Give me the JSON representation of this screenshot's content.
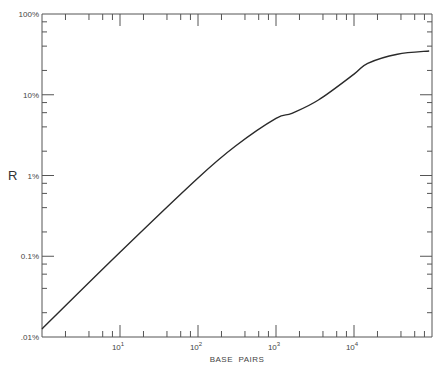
{
  "chart_data": {
    "type": "line",
    "title": "",
    "xlabel": "BASE  PAIRS",
    "ylabel": "R",
    "xscale": "log",
    "yscale": "log",
    "xlim": [
      1,
      100000
    ],
    "ylim": [
      0.01,
      100
    ],
    "grid": false,
    "legend": "none",
    "x_ticks": [
      {
        "value": 10,
        "base": "10",
        "exp": "1"
      },
      {
        "value": 100,
        "base": "10",
        "exp": "2"
      },
      {
        "value": 1000,
        "base": "10",
        "exp": "3"
      },
      {
        "value": 10000,
        "base": "10",
        "exp": "4"
      }
    ],
    "y_ticks": [
      {
        "value": 100,
        "label": "100%"
      },
      {
        "value": 10,
        "label": "10%"
      },
      {
        "value": 1,
        "label": "1%"
      },
      {
        "value": 0.1,
        "label": "0.1%"
      },
      {
        "value": 0.01,
        "label": ".01%"
      }
    ],
    "series": [
      {
        "name": "R",
        "x": [
          1,
          10,
          100,
          300,
          1000,
          1600,
          3500,
          10000,
          15000,
          36000,
          92000
        ],
        "y": [
          0.0126,
          0.112,
          0.93,
          2.3,
          5.1,
          5.9,
          8.6,
          18,
          24.5,
          31.8,
          34.8
        ]
      }
    ]
  }
}
